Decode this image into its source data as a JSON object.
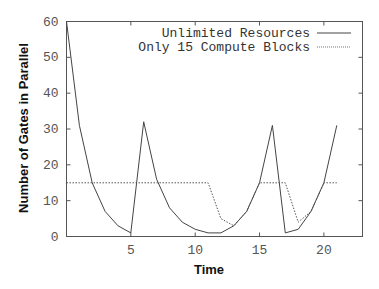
{
  "chart_data": {
    "type": "line",
    "title": "",
    "xlabel": "Time",
    "ylabel": "Number of Gates in Parallel",
    "xlim": [
      0,
      23
    ],
    "ylim": [
      0,
      60
    ],
    "xticks": [
      5,
      10,
      15,
      20
    ],
    "yticks": [
      0,
      10,
      20,
      30,
      40,
      50,
      60
    ],
    "grid": false,
    "legend_position": "top-right",
    "x": [
      0,
      1,
      2,
      3,
      4,
      5,
      6,
      7,
      8,
      9,
      10,
      11,
      12,
      13,
      14,
      15,
      16,
      17,
      18,
      19,
      20,
      21
    ],
    "series": [
      {
        "name": "Unlimited Resources",
        "style": "solid",
        "color": "#444444",
        "values": [
          60,
          31,
          15,
          7,
          3,
          1,
          32,
          16,
          8,
          4,
          2,
          1,
          1,
          3,
          7,
          15,
          31,
          1,
          2,
          7,
          15,
          31
        ]
      },
      {
        "name": "Only 15 Compute Blocks",
        "style": "dotted",
        "color": "#555555",
        "values": [
          15,
          15,
          15,
          15,
          15,
          15,
          15,
          15,
          15,
          15,
          15,
          15,
          5,
          3,
          7,
          15,
          15,
          15,
          4,
          7,
          15,
          15
        ]
      }
    ]
  },
  "labels": {
    "x_axis_title": "Time",
    "y_axis_title": "Number of Gates in Parallel",
    "legend_1": "Unlimited Resources",
    "legend_2": "Only 15 Compute Blocks"
  }
}
